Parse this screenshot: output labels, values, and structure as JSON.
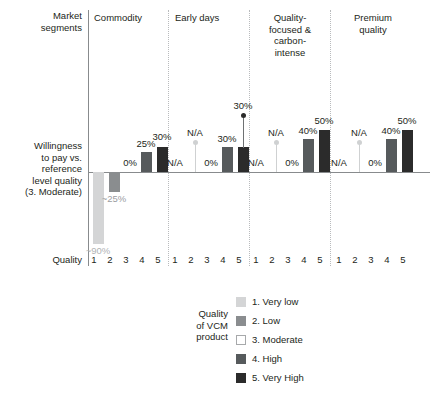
{
  "axis_labels": {
    "market_segments": "Market\nsegments",
    "y_axis": "Willingness\nto pay vs.\nreference\nlevel quality\n(3. Moderate)",
    "quality": "Quality"
  },
  "legend": {
    "title": "Quality\nof VCM\nproduct",
    "items": [
      {
        "label": "1. Very low",
        "color": "#d4d5d6"
      },
      {
        "label": "2. Low",
        "color": "#8a8d8f"
      },
      {
        "label": "3. Moderate",
        "color": "#ffffff"
      },
      {
        "label": "4. High",
        "color": "#565a5c"
      },
      {
        "label": "5. Very High",
        "color": "#2b2b2b"
      }
    ]
  },
  "segments": [
    {
      "header": "Commodity"
    },
    {
      "header": "Early days"
    },
    {
      "header": "Quality-\nfocused &\ncarbon-\nintense"
    },
    {
      "header": "Premium\nquality"
    }
  ],
  "xticks": [
    "1",
    "2",
    "3",
    "4",
    "5",
    "1",
    "2",
    "3",
    "4",
    "5",
    "1",
    "2",
    "3",
    "4",
    "5",
    "1",
    "2",
    "3",
    "4",
    "5"
  ],
  "value_labels": {
    "commodity": [
      "~90%",
      "~25%",
      "0%",
      "25%",
      "30%"
    ],
    "early": [
      "N/A",
      "N/A",
      "0%",
      "30%",
      "30%"
    ],
    "quality": [
      "N/A",
      "N/A",
      "0%",
      "40%",
      "50%"
    ],
    "premium": [
      "N/A",
      "N/A",
      "0%",
      "40%",
      "50%"
    ]
  },
  "chart_data": {
    "type": "bar",
    "title": "",
    "xlabel": "Quality",
    "ylabel": "Willingness to pay vs. reference level quality (3. Moderate)",
    "grid": false,
    "legend_position": "bottom",
    "categories": [
      "1. Very low",
      "2. Low",
      "3. Moderate",
      "4. High",
      "5. Very High"
    ],
    "category_codes": [
      "1",
      "2",
      "3",
      "4",
      "5"
    ],
    "ylim": [
      -100,
      60
    ],
    "units": "percent",
    "groups": [
      {
        "name": "Commodity",
        "values": [
          -90,
          -25,
          0,
          25,
          30
        ],
        "labels": [
          "~90%",
          "~25%",
          "0%",
          "25%",
          "30%"
        ],
        "na": [
          false,
          false,
          false,
          false,
          false
        ]
      },
      {
        "name": "Early days",
        "values": [
          null,
          null,
          0,
          30,
          30
        ],
        "labels": [
          "N/A",
          "N/A",
          "0%",
          "30%",
          "30%"
        ],
        "na": [
          true,
          true,
          false,
          false,
          false
        ],
        "marker": {
          "category": "5. Very High",
          "value": 30,
          "label": "30%",
          "color": "#2b2b2b"
        }
      },
      {
        "name": "Quality-focused & carbon-intense",
        "values": [
          null,
          null,
          0,
          40,
          50
        ],
        "labels": [
          "N/A",
          "N/A",
          "0%",
          "40%",
          "50%"
        ],
        "na": [
          true,
          true,
          false,
          false,
          false
        ]
      },
      {
        "name": "Premium quality",
        "values": [
          null,
          null,
          0,
          40,
          50
        ],
        "labels": [
          "N/A",
          "N/A",
          "0%",
          "40%",
          "50%"
        ],
        "na": [
          true,
          true,
          false,
          false,
          false
        ]
      }
    ],
    "series_colors": {
      "1. Very low": "#d4d5d6",
      "2. Low": "#8a8d8f",
      "3. Moderate": "#ffffff",
      "4. High": "#565a5c",
      "5. Very High": "#2b2b2b"
    }
  }
}
